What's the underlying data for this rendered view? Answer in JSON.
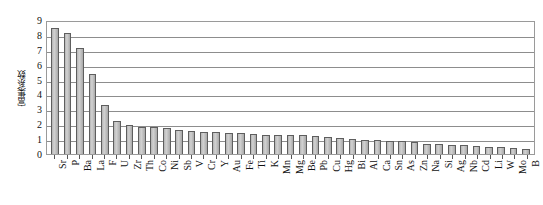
{
  "chart_data": {
    "type": "bar",
    "title": "",
    "xlabel": "",
    "ylabel": "富集系数",
    "ylim": [
      0,
      9
    ],
    "yticks": [
      0,
      1,
      2,
      3,
      4,
      5,
      6,
      7,
      8,
      9
    ],
    "ytick_labels": [
      "0",
      "1",
      "2",
      "3",
      "4",
      "5",
      "6",
      "7",
      "8",
      "9"
    ],
    "grid": true,
    "legend": "none",
    "categories": [
      "Sr",
      "P",
      "Ba",
      "La",
      "F",
      "U",
      "Zr",
      "Th",
      "Co",
      "Ni",
      "Sb",
      "V",
      "Cr",
      "Y",
      "Au",
      "Fe",
      "Ti",
      "K",
      "Mn",
      "Mg",
      "Be",
      "Pb",
      "Cu",
      "Hg",
      "Bi",
      "Al",
      "Ca",
      "Sn",
      "As",
      "Zn",
      "Na",
      "Si",
      "Ag",
      "Nb",
      "Cd",
      "Li",
      "W",
      "Mo",
      "B"
    ],
    "values": [
      8.45,
      8.1,
      7.15,
      5.4,
      3.3,
      2.25,
      1.95,
      1.8,
      1.8,
      1.75,
      1.6,
      1.55,
      1.5,
      1.45,
      1.4,
      1.4,
      1.35,
      1.3,
      1.3,
      1.3,
      1.25,
      1.2,
      1.15,
      1.05,
      1.0,
      0.95,
      0.95,
      0.9,
      0.85,
      0.8,
      0.7,
      0.65,
      0.6,
      0.6,
      0.55,
      0.5,
      0.45,
      0.4,
      0.35
    ],
    "series_name": "富集系数",
    "colors": {
      "bar_fill": "#c8c8c8",
      "bar_edge": "#5e5e5e",
      "grid": "#8d8d8d",
      "frame": "#9a9a9a",
      "text": "#111111",
      "background": "#ffffff"
    }
  }
}
